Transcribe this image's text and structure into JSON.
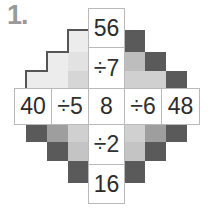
{
  "problem": {
    "number_label": "1."
  },
  "puzzle": {
    "type": "cross-division-grid",
    "center_value": "8",
    "horizontal": {
      "cells": [
        {
          "text": "40",
          "kind": "number"
        },
        {
          "text": "÷5",
          "kind": "operator"
        },
        {
          "text": "8",
          "kind": "number"
        },
        {
          "text": "÷6",
          "kind": "operator"
        },
        {
          "text": "48",
          "kind": "number"
        }
      ]
    },
    "vertical": {
      "cells": [
        {
          "text": "56",
          "kind": "number"
        },
        {
          "text": "÷7",
          "kind": "operator"
        },
        {
          "text": "8",
          "kind": "number"
        },
        {
          "text": "÷2",
          "kind": "operator"
        },
        {
          "text": "16",
          "kind": "number"
        }
      ]
    }
  },
  "colors": {
    "background": "#ffffff",
    "cell_fill": "#ffffff",
    "cell_border": "#b9b9b9",
    "text": "#2b2b2b",
    "number_label": "#9a9a9a",
    "shadow_dark": "#5a5a5a",
    "shadow_mid": "#a8a8a8",
    "shadow_light": "#d6d6d6",
    "shadow_pale": "#ececec",
    "outline_dark": "#555555"
  }
}
